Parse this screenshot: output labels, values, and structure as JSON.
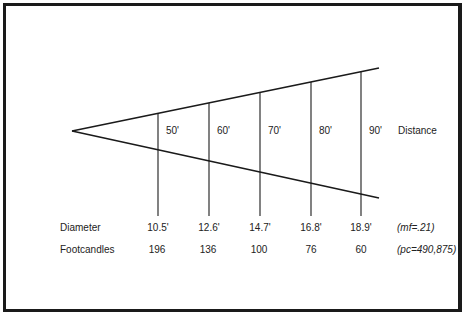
{
  "diagram": {
    "type": "light-beam-spread",
    "apex": {
      "x": 72,
      "y": 131
    },
    "upper_edge_end": {
      "x": 379,
      "y": 68
    },
    "lower_edge_end": {
      "x": 379,
      "y": 198
    },
    "vertical_line_bottom_y": 216,
    "line_color": "#1a1a1a",
    "row_labels": {
      "distance": "Distance",
      "diameter": "Diameter",
      "footcandles": "Footcandles"
    },
    "notes": {
      "diameter": "(mf=.21)",
      "footcandles": "(pc=490,875)"
    },
    "stations": [
      {
        "x": 158,
        "distance": "50'",
        "diameter": "10.5'",
        "footcandles": "196"
      },
      {
        "x": 209,
        "distance": "60'",
        "diameter": "12.6'",
        "footcandles": "136"
      },
      {
        "x": 260,
        "distance": "70'",
        "diameter": "14.7'",
        "footcandles": "100"
      },
      {
        "x": 311,
        "distance": "80'",
        "diameter": "16.8'",
        "footcandles": "76"
      },
      {
        "x": 361,
        "distance": "90'",
        "diameter": "18.9'",
        "footcandles": "60"
      }
    ]
  }
}
